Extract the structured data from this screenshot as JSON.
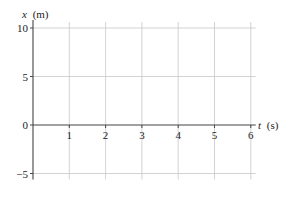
{
  "chart_data": {
    "type": "line",
    "title": "",
    "xlabel": "t (s)",
    "ylabel": "x (m)",
    "x_var": "t",
    "x_unit": "(s)",
    "y_var": "x",
    "y_unit": "(m)",
    "xlim": [
      0,
      6
    ],
    "ylim": [
      -5,
      10
    ],
    "x_ticks": [
      1,
      2,
      3,
      4,
      5,
      6
    ],
    "x_tick_labels": [
      "1",
      "2",
      "3",
      "4",
      "5",
      "6"
    ],
    "y_ticks": [
      -5,
      0,
      5,
      10
    ],
    "y_tick_labels": [
      "−5",
      "0",
      "5",
      "10"
    ],
    "grid": true,
    "series": []
  },
  "colors": {
    "axis": "#444444",
    "grid": "#c8c8c8",
    "text": "#222222"
  }
}
